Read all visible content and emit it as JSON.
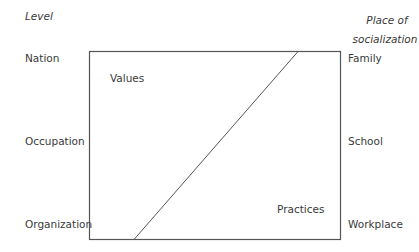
{
  "diagram": {
    "left_axis": {
      "title": "Level",
      "levels": [
        "Nation",
        "Occupation",
        "Organization"
      ]
    },
    "right_axis": {
      "title_line1": "Place of",
      "title_line2": "socialization",
      "places": [
        "Family",
        "School",
        "Workplace"
      ]
    },
    "regions": {
      "upper_left": "Values",
      "lower_right": "Practices"
    },
    "colors": {
      "line": "#555555",
      "text": "#3a3a3a"
    }
  }
}
